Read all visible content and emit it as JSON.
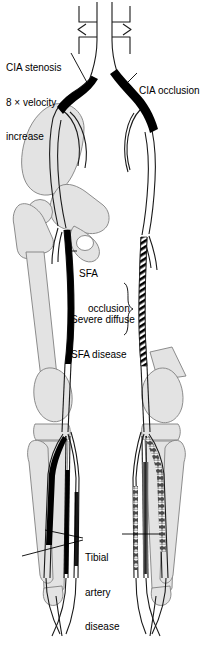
{
  "figure": {
    "type": "medical-illustration",
    "view": "anterior",
    "background_color": "#ffffff",
    "bone_fill_color": "#e3e3e3",
    "bone_stroke_color": "#808080",
    "artery_stroke_color": "#1a1a1a",
    "diseased_segment_color": "#000000",
    "label_text_color": "#000000"
  },
  "labels": {
    "cia_stenosis": {
      "line1": "CIA stenosis",
      "line2": "8 × velocity",
      "line3": "increase",
      "side": "left-leg",
      "points_to": "left common iliac artery"
    },
    "cia_occlusion": {
      "line1": "CIA occlusion",
      "side": "right-leg",
      "points_to": "right common iliac artery"
    },
    "sfa_occlusion": {
      "line1": "SFA",
      "line2": "occlusion",
      "side": "left-leg",
      "points_to": "left superficial femoral artery"
    },
    "sfa_disease": {
      "line1": "Severe diffuse",
      "line2": "SFA disease",
      "side": "right-leg",
      "points_to": "right superficial femoral artery"
    },
    "tibial_disease": {
      "line1": "Tibial",
      "line2": "artery",
      "line3": "disease",
      "side": "both",
      "points_to": "tibial arteries of both legs"
    }
  },
  "findings": [
    {
      "vessel": "Left common iliac artery",
      "lesion": "stenosis",
      "detail": "8 × velocity increase",
      "rendering": "short solid black segment"
    },
    {
      "vessel": "Right common iliac artery",
      "lesion": "occlusion",
      "detail": "",
      "rendering": "long solid black segment"
    },
    {
      "vessel": "Left superficial femoral artery",
      "lesion": "occlusion",
      "detail": "",
      "rendering": "long solid black segment"
    },
    {
      "vessel": "Right superficial femoral artery",
      "lesion": "severe diffuse disease",
      "detail": "",
      "rendering": "hatched / beaded segment"
    },
    {
      "vessel": "Left tibial arteries",
      "lesion": "disease",
      "detail": "",
      "rendering": "solid black segments"
    },
    {
      "vessel": "Right tibial arteries",
      "lesion": "disease",
      "detail": "",
      "rendering": "mottled grey segments"
    }
  ]
}
